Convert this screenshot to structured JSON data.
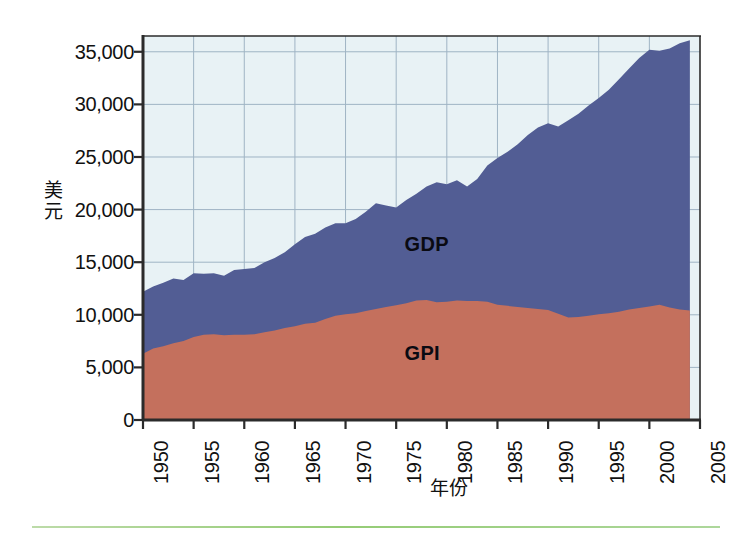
{
  "axes": {
    "y_title": "美元",
    "x_title": "年份",
    "y_ticks": [
      "35,000",
      "30,000",
      "25,000",
      "20,000",
      "15,000",
      "10,000",
      "5,000",
      "0"
    ],
    "x_ticks": [
      "1950",
      "1955",
      "1960",
      "1965",
      "1970",
      "1975",
      "1980",
      "1985",
      "1990",
      "1995",
      "2000",
      "2005"
    ]
  },
  "series_labels": {
    "gdp": "GDP",
    "gpi": "GPI"
  },
  "colors": {
    "gdp_area": "#525d94",
    "gpi_area": "#c4705d",
    "plot_background": "#e8f2f5",
    "gridline": "#9fb4c4",
    "axis": "#2b2b2b",
    "text": "#111111",
    "bottom_rule": "#8fc96e"
  },
  "chart_data": {
    "type": "area",
    "title": "",
    "subtitle": "",
    "xlabel": "年份",
    "ylabel": "美元",
    "xlim": [
      1950,
      2005
    ],
    "ylim": [
      0,
      36500
    ],
    "grid": true,
    "stacked": false,
    "legend": "in-plot annotations",
    "y_tick_values": [
      0,
      5000,
      10000,
      15000,
      20000,
      25000,
      30000,
      35000
    ],
    "x_tick_values": [
      1950,
      1955,
      1960,
      1965,
      1970,
      1975,
      1980,
      1985,
      1990,
      1995,
      2000,
      2005
    ],
    "x": [
      1950,
      1951,
      1952,
      1953,
      1954,
      1955,
      1956,
      1957,
      1958,
      1959,
      1960,
      1961,
      1962,
      1963,
      1964,
      1965,
      1966,
      1967,
      1968,
      1969,
      1970,
      1971,
      1972,
      1973,
      1974,
      1975,
      1976,
      1977,
      1978,
      1979,
      1980,
      1981,
      1982,
      1983,
      1984,
      1985,
      1986,
      1987,
      1988,
      1989,
      1990,
      1991,
      1992,
      1993,
      1994,
      1995,
      1996,
      1997,
      1998,
      1999,
      2000,
      2001,
      2002,
      2003,
      2004
    ],
    "series": [
      {
        "name": "GDP",
        "color": "#525d94",
        "values": [
          12200,
          12700,
          13050,
          13450,
          13300,
          13950,
          13900,
          13950,
          13700,
          14250,
          14350,
          14450,
          15000,
          15400,
          15950,
          16700,
          17400,
          17700,
          18300,
          18700,
          18700,
          19100,
          19800,
          20600,
          20400,
          20200,
          20900,
          21500,
          22200,
          22600,
          22400,
          22800,
          22200,
          22900,
          24200,
          24900,
          25500,
          26200,
          27100,
          27800,
          28200,
          27900,
          28500,
          29100,
          29900,
          30600,
          31400,
          32400,
          33400,
          34400,
          35200,
          35100,
          35300,
          35800,
          36100
        ]
      },
      {
        "name": "GPI",
        "color": "#c4705d",
        "values": [
          6300,
          6800,
          7000,
          7300,
          7500,
          7900,
          8100,
          8150,
          8050,
          8100,
          8100,
          8150,
          8350,
          8500,
          8750,
          8900,
          9150,
          9250,
          9600,
          9900,
          10050,
          10150,
          10350,
          10550,
          10750,
          10900,
          11100,
          11350,
          11400,
          11200,
          11250,
          11350,
          11300,
          11300,
          11250,
          10950,
          10850,
          10750,
          10650,
          10550,
          10450,
          10100,
          9750,
          9800,
          9900,
          10050,
          10150,
          10300,
          10500,
          10650,
          10800,
          10950,
          10700,
          10500,
          10400
        ]
      }
    ],
    "annotations": [
      {
        "text": "GDP",
        "x": 1978,
        "y": 16500
      },
      {
        "text": "GPI",
        "x": 1978,
        "y": 6200
      }
    ]
  }
}
